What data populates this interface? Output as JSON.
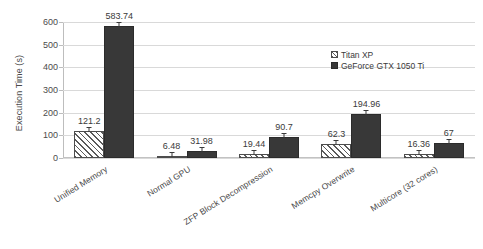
{
  "chart_data": {
    "type": "bar",
    "title": "",
    "xlabel": "",
    "ylabel": "Execution Time (s)",
    "ylim": [
      0,
      600
    ],
    "yticks": [
      0,
      100,
      200,
      300,
      400,
      500,
      600
    ],
    "grid": true,
    "legend_position": "center-right",
    "categories": [
      "Unified Memory",
      "Normal GPU",
      "ZFP Block Decompression",
      "Memcpy Overwrite",
      "Multicore (32 cores)"
    ],
    "series": [
      {
        "name": "Titan XP",
        "values": [
          121.2,
          6.48,
          19.44,
          62.3,
          16.36
        ],
        "labels": [
          "121.2",
          "6.48",
          "19.44",
          "62.3",
          "16.36"
        ],
        "fill": "hatched",
        "color": "#ffffff"
      },
      {
        "name": "GeForce GTX 1050 Ti",
        "values": [
          583.74,
          31.98,
          90.7,
          194.96,
          67
        ],
        "labels": [
          "583.74",
          "31.98",
          "90.7",
          "194.96",
          "67"
        ],
        "fill": "solid",
        "color": "#383838"
      }
    ]
  },
  "axis": {
    "y_title": "Execution Time (s)",
    "y_tick_labels": [
      "600",
      "500",
      "400",
      "300",
      "200",
      "100",
      "0"
    ]
  },
  "legend": {
    "items": [
      {
        "label": "Titan XP"
      },
      {
        "label": "GeForce GTX 1050 Ti"
      }
    ]
  },
  "colors": {
    "series1": "#ffffff",
    "series2": "#383838",
    "grid": "#d9d9d9",
    "text": "#3b3b3b",
    "background": "#ffffff"
  }
}
